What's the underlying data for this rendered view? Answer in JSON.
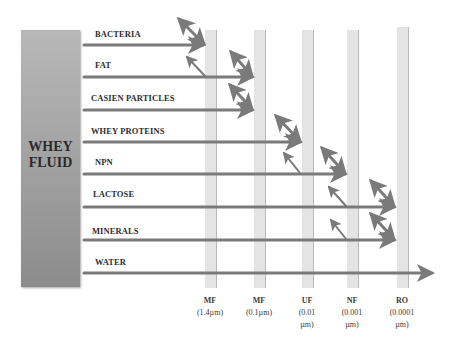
{
  "diagram": {
    "source_label": "WHEY FLUID",
    "source_lines": [
      "WHEY",
      "FLUID"
    ],
    "colors": {
      "arrow": "#7a7a7a",
      "membrane": "#e4e4e4",
      "fluid_top": "#b8b8b8",
      "fluid_bottom": "#8c8c8c"
    },
    "components": [
      {
        "label": "BACTERIA",
        "retained_at": "MF (1.4µm)"
      },
      {
        "label": "FAT",
        "retained_at": "MF (0.1µm)"
      },
      {
        "label": "CASIEN PARTICLES",
        "retained_at": "MF (0.1µm)"
      },
      {
        "label": "WHEY PROTEINS",
        "retained_at": "UF (0.01 µm)"
      },
      {
        "label": "NPN",
        "retained_at": "NF (0.001 µm)"
      },
      {
        "label": "LACTOSE",
        "retained_at": "RO (0.0001 µm)"
      },
      {
        "label": "MINERALS",
        "retained_at": "RO (0.0001 µm)"
      },
      {
        "label": "WATER",
        "retained_at": "passes all"
      }
    ],
    "membranes": [
      {
        "name": "MF",
        "size": "(1.4µm)",
        "size_lines": [
          "(1.4µm)"
        ]
      },
      {
        "name": "MF",
        "size": "(0.1µm)",
        "size_lines": [
          "(0.1µm)"
        ]
      },
      {
        "name": "UF",
        "size": "(0.01 µm)",
        "size_lines": [
          "(0.01",
          "µm)"
        ]
      },
      {
        "name": "NF",
        "size": "(0.001 µm)",
        "size_lines": [
          "(0.001",
          "µm)"
        ]
      },
      {
        "name": "RO",
        "size": "(0.0001 µm)",
        "size_lines": [
          "(0.0001",
          "µm)"
        ]
      }
    ]
  }
}
